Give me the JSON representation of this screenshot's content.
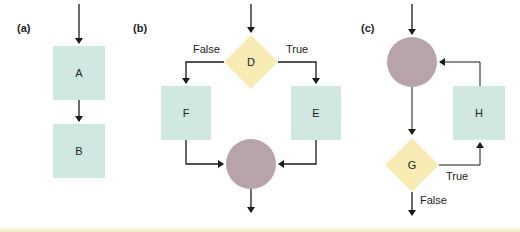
{
  "colors": {
    "process_box": "#cfe8e2",
    "decision_diamond": "#f8ebb4",
    "junction_circle": "#b9a3ab",
    "line": "#1a1a1a",
    "bottom_rule": "#f3e5ad"
  },
  "panels": [
    {
      "id": "a",
      "label": "(a)",
      "kind": "sequence",
      "nodes": [
        {
          "id": "A",
          "shape": "box",
          "label": "A"
        },
        {
          "id": "B",
          "shape": "box",
          "label": "B"
        }
      ]
    },
    {
      "id": "b",
      "label": "(b)",
      "kind": "selection",
      "nodes": [
        {
          "id": "D",
          "shape": "diamond",
          "label": "D"
        },
        {
          "id": "F",
          "shape": "box",
          "label": "F"
        },
        {
          "id": "E",
          "shape": "box",
          "label": "E"
        },
        {
          "id": "join",
          "shape": "circle",
          "label": ""
        }
      ],
      "branch_labels": {
        "false": "False",
        "true": "True"
      }
    },
    {
      "id": "c",
      "label": "(c)",
      "kind": "loop",
      "nodes": [
        {
          "id": "join",
          "shape": "circle",
          "label": ""
        },
        {
          "id": "G",
          "shape": "diamond",
          "label": "G"
        },
        {
          "id": "H",
          "shape": "box",
          "label": "H"
        }
      ],
      "branch_labels": {
        "true": "True",
        "false": "False"
      }
    }
  ]
}
